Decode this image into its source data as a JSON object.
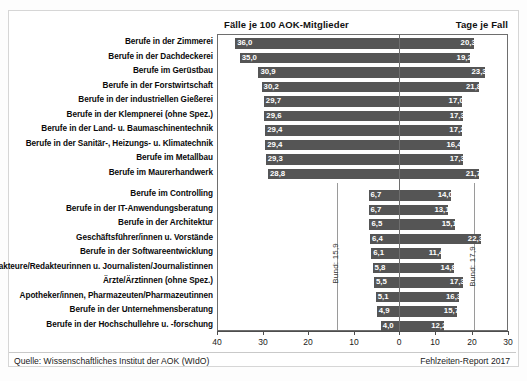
{
  "figure": {
    "header_left": "Fälle je 100 AOK-Mitglieder",
    "header_right": "Tage je Fall",
    "source": "Quelle: Wissenschaftliches Institut der AOK (WIdO)",
    "report": "Fehlzeiten-Report 2017",
    "bund_left_label": "Bund: 15,9",
    "bund_right_label": "Bund: 17,9"
  },
  "chart_data": {
    "type": "bar",
    "orientation": "horizontal",
    "layout": "diverging-bidirectional",
    "title": "",
    "xlabel": "",
    "ylabel": "",
    "left_axis": {
      "label": "Fälle je 100 AOK-Mitglieder",
      "ticks": [
        40,
        30,
        20,
        10,
        0
      ],
      "tick_labels": [
        "40",
        "30",
        "20",
        "10",
        "0"
      ],
      "range": [
        40,
        0
      ],
      "direction": "right-to-left",
      "reference_line": 15.9,
      "reference_label": "Bund: 15,9"
    },
    "right_axis": {
      "label": "Tage je Fall",
      "ticks": [
        0,
        10,
        20,
        30
      ],
      "tick_labels": [
        "0",
        "10",
        "20",
        "30"
      ],
      "range": [
        0,
        30
      ],
      "direction": "left-to-right",
      "reference_line": 17.9,
      "reference_label": "Bund: 17,9"
    },
    "grid": false,
    "legend": false,
    "bar_color": "#555555",
    "shade_band_color": "#ebebeb",
    "categories": [
      "Berufe in der Zimmerei",
      "Berufe in der Dachdeckerei",
      "Berufe im Gerüstbau",
      "Berufe in der Forstwirtschaft",
      "Berufe in der industriellen Gießerei",
      "Berufe in der Klempnerei (ohne Spez.)",
      "Berufe in der Land- u. Baumaschinentechnik",
      "Berufe in der Sanitär-, Heizungs- u. Klimatechnik",
      "Berufe im Metallbau",
      "Berufe im Maurerhandwerk",
      "Berufe im Controlling",
      "Berufe in der IT-Anwendungsberatung",
      "Berufe in der Architektur",
      "Geschäftsführer/innen u. Vorstände",
      "Berufe in der Softwareentwicklung",
      "Redakteure/Redakteurinnen u. Journalisten/Journalistinnen",
      "Ärzte/Ärztinnen (ohne Spez.)",
      "Apotheker/innen, Pharmazeuten/Pharmazeutinnen",
      "Berufe in der Unternehmensberatung",
      "Berufe in der Hochschullehre u. -forschung"
    ],
    "series": [
      {
        "name": "Fälle je 100 AOK-Mitglieder",
        "side": "left",
        "values": [
          36.0,
          35.0,
          30.9,
          30.2,
          29.7,
          29.6,
          29.4,
          29.4,
          29.3,
          28.8,
          6.7,
          6.7,
          6.5,
          6.4,
          6.1,
          5.8,
          5.5,
          5.1,
          4.9,
          4.0
        ],
        "value_labels": [
          "36,0",
          "35,0",
          "30,9",
          "30,2",
          "29,7",
          "29,6",
          "29,4",
          "29,4",
          "29,3",
          "28,8",
          "6,7",
          "6,7",
          "6,5",
          "6,4",
          "6,1",
          "5,8",
          "5,5",
          "5,1",
          "4,9",
          "4,0"
        ]
      },
      {
        "name": "Tage je Fall",
        "side": "right",
        "values": [
          20.3,
          19.2,
          23.3,
          21.8,
          17.0,
          17.3,
          17.2,
          16.4,
          17.3,
          21.7,
          14.0,
          13.1,
          15.1,
          22.3,
          11.4,
          14.8,
          17.3,
          16.3,
          15.7,
          12.2
        ],
        "value_labels": [
          "20,3",
          "19,2",
          "23,3",
          "21,8",
          "17,0",
          "17,3",
          "17,2",
          "16,4",
          "17,3",
          "21,7",
          "14,0",
          "13,1",
          "15,1",
          "22,3",
          "11,4",
          "14,8",
          "17,3",
          "16,3",
          "15,7",
          "12,2"
        ]
      }
    ],
    "group_break_after_index": 9
  }
}
